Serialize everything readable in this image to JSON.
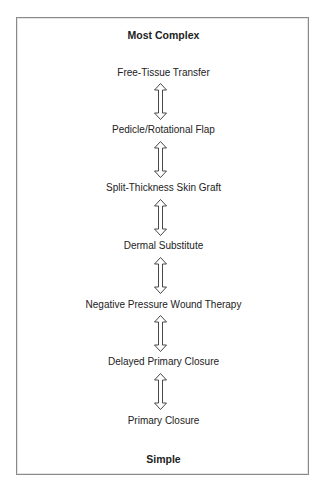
{
  "diagram": {
    "top_label": "Most Complex",
    "bottom_label": "Simple",
    "steps": [
      "Free-Tissue Transfer",
      "Pedicle/Rotational Flap",
      "Split-Thickness Skin Graft",
      "Dermal Substitute",
      "Negative Pressure Wound Therapy",
      "Delayed Primary Closure",
      "Primary Closure"
    ],
    "connector_icon": "double-headed-vertical-arrow-icon",
    "colors": {
      "text": "#222222",
      "border": "#8a8a8a",
      "arrow_stroke": "#333333"
    }
  }
}
